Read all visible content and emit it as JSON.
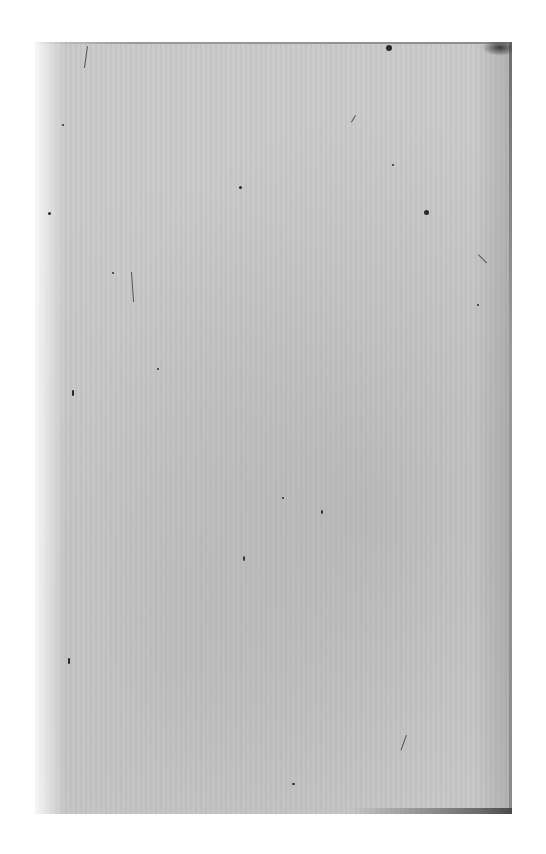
{
  "document": {
    "type": "scanned-page",
    "content": "",
    "text_lines": [],
    "paper_color": "#c9c9c9",
    "background_color": "#ffffff"
  }
}
